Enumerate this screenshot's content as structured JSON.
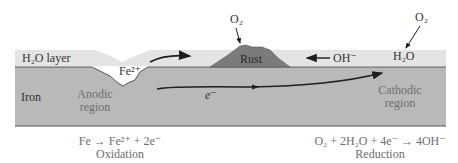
{
  "colors": {
    "water": "#e4e4e4",
    "iron": "#b9b9b9",
    "rust": "#7b7b7b",
    "outline": "#555555",
    "arrow": "#1e1e1e",
    "label_dark": "#333333",
    "label_gray": "#6e6e6e"
  },
  "labels": {
    "water_layer": "H₂O layer",
    "iron": "Iron",
    "anodic_line1": "Anodic",
    "anodic_line2": "region",
    "cathodic_line1": "Cathodic",
    "cathodic_line2": "region",
    "fe2plus": "Fe²⁺",
    "rust": "Rust",
    "hydroxide": "OH⁻",
    "o2_rust": "O₂",
    "o2_right": "O₂",
    "h2o_right": "H₂O",
    "electron": "e⁻"
  },
  "equations": {
    "oxidation_eq": "Fe → Fe²⁺ + 2e⁻",
    "oxidation_name": "Oxidation",
    "reduction_eq": "O₂ + 2H₂O + 4e⁻ → 4OH⁻",
    "reduction_name": "Reduction"
  }
}
